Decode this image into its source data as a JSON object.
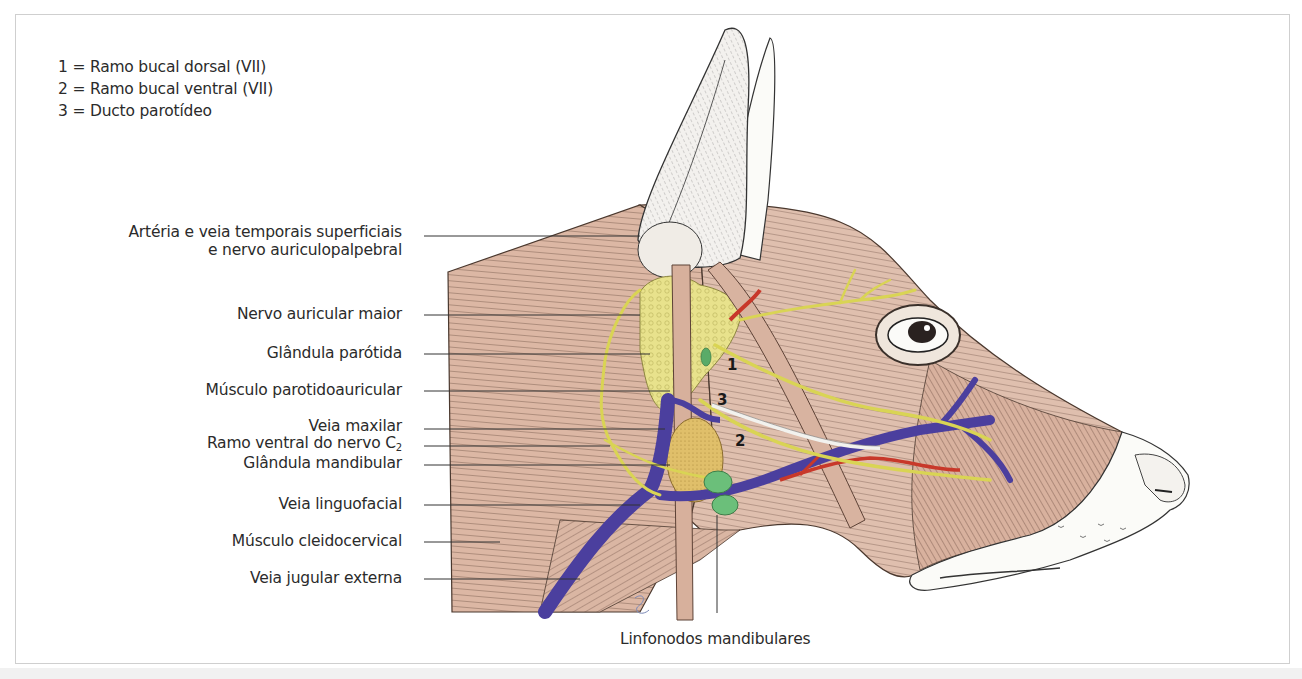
{
  "figure": {
    "type": "anatomical-illustration",
    "legend": [
      {
        "key": "1",
        "text": "1 = Ramo bucal dorsal (VII)"
      },
      {
        "key": "2",
        "text": "2 = Ramo bucal ventral (VII)"
      },
      {
        "key": "3",
        "text": "3 = Ducto parotídeo"
      }
    ],
    "callouts": [
      {
        "id": "arteria-veia-temporais",
        "line1": "Artéria e veia temporais superficiais",
        "line2": "e nervo auriculopalpebral"
      },
      {
        "id": "nervo-auricular-maior",
        "text": "Nervo auricular maior"
      },
      {
        "id": "glandula-parotida",
        "text": "Glândula parótida"
      },
      {
        "id": "musculo-parotidoauricular",
        "text": "Músculo parotidoauricular"
      },
      {
        "id": "veia-maxilar",
        "text": "Veia maxilar"
      },
      {
        "id": "ramo-ventral-c2",
        "text": "Ramo ventral do nervo C",
        "subscript": "2"
      },
      {
        "id": "glandula-mandibular",
        "text": "Glândula mandibular"
      },
      {
        "id": "veia-linguofacial",
        "text": "Veia linguofacial"
      },
      {
        "id": "musculo-cleidocervical",
        "text": "Músculo cleidocervical"
      },
      {
        "id": "veia-jugular-externa",
        "text": "Veia jugular externa"
      }
    ],
    "bottom_callout": {
      "id": "linfonodos-mandibulares",
      "text": "Linfonodos mandibulares"
    },
    "numbered_markers": [
      "1",
      "2",
      "3"
    ],
    "colors": {
      "muscle": "#d9b3a0",
      "muscle_dark": "#b98c78",
      "gland_parotid": "#e6e08a",
      "gland_mandibular": "#e0c069",
      "lymph_node": "#6bbf7a",
      "vein": "#4b3f9e",
      "artery": "#c8382a",
      "nerve": "#d9d454",
      "duct": "#f2f2ee",
      "skin_white": "#fbfbf8",
      "outline": "#3a302a",
      "leader_line": "#333333",
      "frame": "#cfcfcf"
    }
  }
}
